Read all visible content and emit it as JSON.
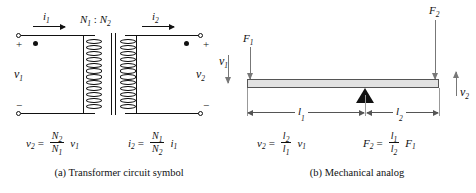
{
  "figure": {
    "panel_a": {
      "caption": "(a) Transformer circuit symbol",
      "turns_ratio": "N",
      "turns_ratio_sub1": "1",
      "turns_ratio_colon": " : ",
      "turns_ratio_n2": "N",
      "turns_ratio_sub2": "2",
      "current_in": "i",
      "current_in_sub": "1",
      "current_out": "i",
      "current_out_sub": "2",
      "voltage_in": "v",
      "voltage_in_sub": "1",
      "voltage_out": "v",
      "voltage_out_sub": "2",
      "plus_left": "+",
      "minus_left": "−",
      "plus_right": "+",
      "minus_right": "−",
      "equation_voltage": {
        "lhs": "v",
        "lhs_sub": "2",
        "operator": "=",
        "numerator": "N",
        "numerator_sub": "2",
        "denominator": "N",
        "denominator_sub": "1",
        "tail": "v",
        "tail_sub": "1"
      },
      "equation_current": {
        "lhs": "i",
        "lhs_sub": "2",
        "operator": "=",
        "numerator": "N",
        "numerator_sub": "1",
        "denominator": "N",
        "denominator_sub": "2",
        "tail": "i",
        "tail_sub": "1"
      }
    },
    "panel_b": {
      "caption": "(b) Mechanical analog",
      "force_in": "F",
      "force_in_sub": "1",
      "force_out": "F",
      "force_out_sub": "2",
      "velocity_in": "v",
      "velocity_in_sub": "1",
      "velocity_out": "v",
      "velocity_out_sub": "2",
      "length_left": "l",
      "length_left_sub": "1",
      "length_right": "l",
      "length_right_sub": "2",
      "equation_velocity": {
        "lhs": "v",
        "lhs_sub": "2",
        "operator": "=",
        "numerator": "l",
        "numerator_sub": "2",
        "denominator": "l",
        "denominator_sub": "1",
        "tail": "v",
        "tail_sub": "1"
      },
      "equation_force": {
        "lhs": "F",
        "lhs_sub": "2",
        "operator": "=",
        "numerator": "l",
        "numerator_sub": "1",
        "denominator": "l",
        "denominator_sub": "2",
        "tail": "F",
        "tail_sub": "1"
      }
    },
    "colors": {
      "ink": "#111111",
      "beam_fill": "#e2e2e2",
      "beam_stroke": "#555555",
      "arrow_gray": "#777777",
      "dimension_gray": "#555555"
    },
    "coil_loop_count": 12
  }
}
